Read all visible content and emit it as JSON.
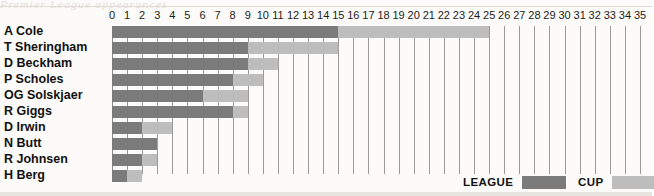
{
  "chart_data": {
    "type": "bar",
    "orientation": "horizontal",
    "stacked": true,
    "title": "",
    "xlabel": "",
    "ylabel": "",
    "xlim": [
      0,
      35
    ],
    "grid": true,
    "legend_position": "bottom-right",
    "categories": [
      "A Cole",
      "T Sheringham",
      "D Beckham",
      "P Scholes",
      "OG Solskjaer",
      "R Giggs",
      "D Irwin",
      "N Butt",
      "R Johnsen",
      "H Berg"
    ],
    "tick_labels": [
      "0",
      "1",
      "2",
      "3",
      "4",
      "5",
      "6",
      "7",
      "8",
      "9",
      "10",
      "11",
      "12",
      "13",
      "14",
      "15",
      "16",
      "17",
      "18",
      "19",
      "20",
      "21",
      "22",
      "23",
      "24",
      "25",
      "26",
      "27",
      "28",
      "29",
      "30",
      "31",
      "32",
      "33",
      "34",
      "35"
    ],
    "series": [
      {
        "name": "LEAGUE",
        "color": "#7b7b7b",
        "values": [
          15,
          9,
          9,
          8,
          6,
          8,
          2,
          3,
          2,
          1
        ]
      },
      {
        "name": "CUP",
        "color": "#bdbdbd",
        "values": [
          10,
          6,
          2,
          2,
          3,
          1,
          2,
          0,
          1,
          1
        ]
      }
    ],
    "totals": [
      25,
      15,
      11,
      10,
      9,
      9,
      4,
      3,
      3,
      2
    ]
  },
  "legend": {
    "league_label": "LEAGUE",
    "cup_label": "CUP"
  },
  "artifact": {
    "top_bleed": "Premier League appearances"
  }
}
